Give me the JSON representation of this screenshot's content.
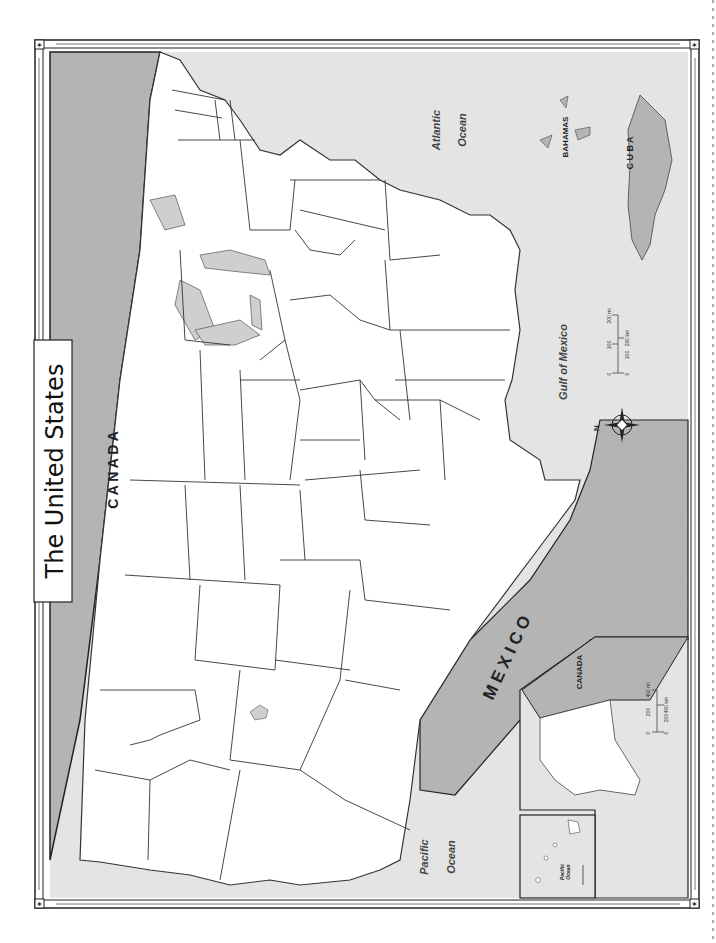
{
  "title": "The United States",
  "colors": {
    "page": "#ffffff",
    "ocean": "#e4e4e4",
    "foreign_land": "#b4b4b4",
    "lakes": "#cfcfcf",
    "us_land": "#ffffff",
    "border": "#333333",
    "frame": "#222222"
  },
  "labels": {
    "canada": "C A N A D A",
    "mexico": "M E X I C O",
    "atlantic_1": "Atlantic",
    "atlantic_2": "Ocean",
    "pacific_1": "Pacific",
    "pacific_2": "Ocean",
    "gulf": "Gulf of Mexico",
    "bahamas": "BAHAMAS",
    "cuba": "C U B A"
  },
  "compass": {
    "north_label": "N"
  },
  "scale_bar": {
    "miles": [
      "0",
      "100",
      "200 mi"
    ],
    "km": [
      "0",
      "100",
      "200 km"
    ]
  },
  "inset_alaska": {
    "canada_label": "CANADA",
    "scale_miles": [
      "0",
      "200",
      "400 mi"
    ],
    "scale_km": [
      "0",
      "200",
      "400 km"
    ]
  },
  "inset_hawaii": {
    "ocean_1": "Pacific",
    "ocean_2": "Ocean"
  }
}
